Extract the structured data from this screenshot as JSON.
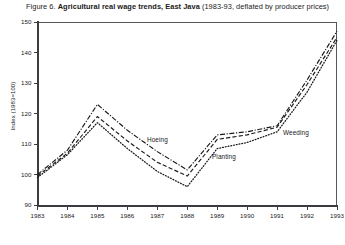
{
  "caption": {
    "figure_number": "Figure 6.",
    "title": "Agricultural real wage trends, East Java",
    "subtitle": "(1983-93, deflated by producer prices)"
  },
  "axes": {
    "y_title": "Index (1983=100)",
    "y_ticks": [
      "90",
      "100",
      "110",
      "120",
      "130",
      "140",
      "150"
    ],
    "y_min": 90,
    "y_max": 150,
    "x_ticks": [
      "1983",
      "1984",
      "1985",
      "1986",
      "1987",
      "1988",
      "1989",
      "1990",
      "1991",
      "1992",
      "1993"
    ],
    "x_min": 1983,
    "x_max": 1993
  },
  "annotations": {
    "hoeing": "Hoeing",
    "planting": "Planting",
    "weeding": "Weeding"
  },
  "colors": {
    "line": "#1a1a1a",
    "axis": "#3c3c40",
    "frame": "#55555a",
    "background": "#ffffff"
  },
  "chart_data": {
    "type": "line",
    "title": "Agricultural real wage trends, East Java",
    "subtitle": "(1983-93, deflated by producer prices)",
    "xlabel": "",
    "ylabel": "Index (1983=100)",
    "x": [
      1983,
      1984,
      1985,
      1986,
      1987,
      1988,
      1989,
      1990,
      1991,
      1992,
      1993
    ],
    "xlim": [
      1983,
      1993
    ],
    "ylim": [
      90,
      150
    ],
    "grid": false,
    "legend_position": "inline-annotations",
    "series": [
      {
        "name": "Hoeing",
        "style": "dash-dot",
        "values": [
          100.0,
          108.0,
          123.0,
          114.5,
          107.5,
          101.5,
          113.0,
          114.0,
          116.0,
          131.0,
          147.0
        ]
      },
      {
        "name": "Planting",
        "style": "dashed",
        "values": [
          99.5,
          107.0,
          119.0,
          111.0,
          104.0,
          99.5,
          111.5,
          113.0,
          115.5,
          129.5,
          145.0
        ]
      },
      {
        "name": "Weeding",
        "style": "dotted",
        "values": [
          99.0,
          106.5,
          117.0,
          108.5,
          101.0,
          96.0,
          108.5,
          110.5,
          114.0,
          127.0,
          144.0
        ]
      }
    ]
  }
}
